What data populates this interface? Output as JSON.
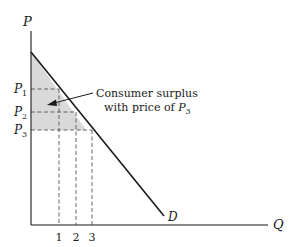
{
  "diagram": {
    "type": "consumer-surplus",
    "axes": {
      "y_label": "P",
      "x_label": "Q"
    },
    "price_levels": [
      {
        "label": "P",
        "sub": "1"
      },
      {
        "label": "P",
        "sub": "2"
      },
      {
        "label": "P",
        "sub": "3"
      }
    ],
    "quantity_ticks": [
      "1",
      "2",
      "3"
    ],
    "demand_label": "D",
    "annotation": {
      "line1": "Consumer surplus",
      "line2_prefix": "with price of ",
      "line2_var": "P",
      "line2_sub": "3"
    },
    "colors": {
      "shade": "#d9d9d9",
      "line": "#1a1a1a",
      "dash": "#555555"
    }
  }
}
